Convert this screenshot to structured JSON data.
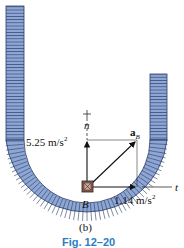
{
  "figure": {
    "panel_label": "(b)",
    "caption": "Fig. 12–20",
    "point_label": "B",
    "normal_axis": {
      "label": "n",
      "sign": "+"
    },
    "tangent_axis": {
      "label": "t"
    },
    "vectors": {
      "resultant": {
        "label": "a",
        "subscript": "B"
      },
      "normal_component": {
        "value": "5.25 m/s",
        "exponent": "2"
      },
      "tangential_component": {
        "value": "1.14 m/s",
        "exponent": "2"
      }
    },
    "colors": {
      "track_fill": "#7d97c8",
      "track_stroke": "#2b3d66",
      "caption": "#2a7dc4",
      "block": "#9a5a4a"
    }
  }
}
